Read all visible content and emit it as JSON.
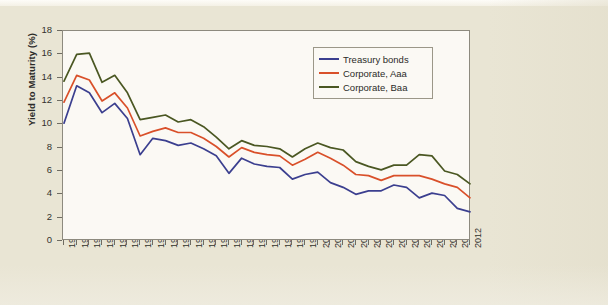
{
  "chart_data": {
    "type": "line",
    "title": "",
    "xlabel": "",
    "ylabel": "Yield to Maturity (%)",
    "ylim": [
      0,
      18
    ],
    "ytick_step": 2,
    "yticks": [
      0,
      2,
      4,
      6,
      8,
      10,
      12,
      14,
      16,
      18
    ],
    "grid": false,
    "legend_position": "upper-right-inside",
    "x": [
      1980,
      1981,
      1982,
      1983,
      1984,
      1985,
      1986,
      1987,
      1988,
      1989,
      1990,
      1991,
      1992,
      1993,
      1994,
      1995,
      1996,
      1997,
      1998,
      1999,
      2000,
      2001,
      2002,
      2003,
      2004,
      2005,
      2006,
      2007,
      2008,
      2009,
      2010,
      2011,
      2012
    ],
    "categories": [
      "1980",
      "1981",
      "1982",
      "1983",
      "1984",
      "1985",
      "1986",
      "1987",
      "1988",
      "1989",
      "1990",
      "1991",
      "1992",
      "1993",
      "1994",
      "1995",
      "1996",
      "1997",
      "1998",
      "1999",
      "2000",
      "2001",
      "2002",
      "2003",
      "2004",
      "2005",
      "2006",
      "2007",
      "2008",
      "2009",
      "2010",
      "2011",
      "2012"
    ],
    "series": [
      {
        "name": "Treasury bonds",
        "color": "#3b3f8f",
        "values": [
          10.1,
          13.3,
          12.7,
          11.0,
          11.8,
          10.5,
          7.4,
          8.8,
          8.6,
          8.2,
          8.4,
          7.9,
          7.3,
          5.8,
          7.1,
          6.6,
          6.4,
          6.3,
          5.3,
          5.7,
          5.9,
          5.0,
          4.6,
          4.0,
          4.3,
          4.3,
          4.8,
          4.6,
          3.7,
          4.1,
          3.9,
          2.8,
          2.5
        ]
      },
      {
        "name": "Corporate, Aaa",
        "color": "#d9502a",
        "values": [
          11.9,
          14.2,
          13.8,
          12.0,
          12.7,
          11.4,
          9.0,
          9.4,
          9.7,
          9.3,
          9.3,
          8.8,
          8.1,
          7.2,
          8.0,
          7.6,
          7.4,
          7.3,
          6.5,
          7.0,
          7.6,
          7.1,
          6.5,
          5.7,
          5.6,
          5.2,
          5.6,
          5.6,
          5.6,
          5.3,
          4.9,
          4.6,
          3.7
        ]
      },
      {
        "name": "Corporate, Baa",
        "color": "#4a5722",
        "values": [
          13.7,
          16.0,
          16.1,
          13.6,
          14.2,
          12.7,
          10.4,
          10.6,
          10.8,
          10.2,
          10.4,
          9.8,
          8.9,
          7.9,
          8.6,
          8.2,
          8.1,
          7.9,
          7.2,
          7.9,
          8.4,
          8.0,
          7.8,
          6.8,
          6.4,
          6.1,
          6.5,
          6.5,
          7.4,
          7.3,
          6.0,
          5.7,
          4.9
        ]
      }
    ]
  },
  "legend": {
    "items": [
      {
        "label": "Treasury bonds",
        "color": "#3b3f8f"
      },
      {
        "label": "Corporate, Aaa",
        "color": "#d9502a"
      },
      {
        "label": "Corporate, Baa",
        "color": "#4a5722"
      }
    ]
  }
}
